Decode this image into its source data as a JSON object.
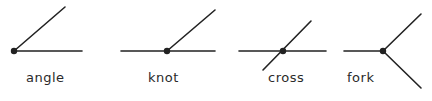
{
  "figure": {
    "junctions": [
      {
        "label": "angle",
        "label_pos": [
          26,
          70
        ]
      },
      {
        "label": "knot",
        "label_pos": [
          148,
          70
        ]
      },
      {
        "label": "cross",
        "label_pos": [
          268,
          70
        ]
      },
      {
        "label": "fork",
        "label_pos": [
          347,
          70
        ]
      }
    ],
    "line_color": "#222222"
  }
}
